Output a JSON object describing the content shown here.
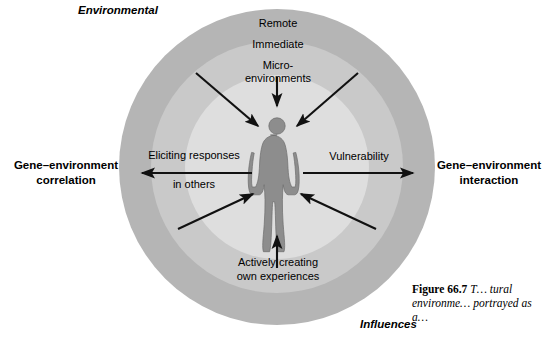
{
  "figure": {
    "rings": {
      "outer_color": "#b3b3b3",
      "middle_color": "#c9c9c9",
      "inner_color": "#dedede"
    },
    "arrow_color": "#111111"
  },
  "labels": {
    "environmental": "Environmental",
    "influences": "Influences",
    "remote": "Remote",
    "immediate": "Immediate",
    "micro_environments_line1": "Micro-",
    "micro_environments_line2": "environments",
    "eliciting_line1": "Eliciting responses",
    "eliciting_line2": "in others",
    "vulnerability": "Vulnerability",
    "actively_line1": "Actively creating",
    "actively_line2": "own experiences",
    "gene_env_correlation_line1": "Gene–environment",
    "gene_env_correlation_line2": "correlation",
    "gene_env_interaction_line1": "Gene–environment",
    "gene_env_interaction_line2": "interaction"
  },
  "caption": {
    "number": "Figure 66.7",
    "text_line1": "T",
    "text_rest": "tural environme  portrayed as a"
  },
  "caption_parts": {
    "bold": "Figure 66.7",
    "italic": " T…\ntural environme…\nportrayed as a…"
  }
}
